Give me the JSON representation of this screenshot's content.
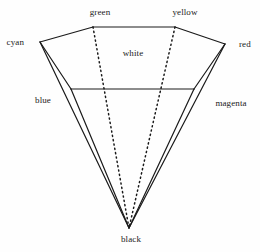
{
  "figure": {
    "background_color": "#fefefe",
    "stroke_color": "#1a1a1a",
    "labels": {
      "green": "green",
      "yellow": "yellow",
      "cyan": "cyan",
      "red": "red",
      "white": "white",
      "blue": "blue",
      "magenta": "magenta",
      "black": "black"
    }
  },
  "chart_data": {
    "type": "diagram",
    "vertices": {
      "cyan": [
        40,
        42
      ],
      "green": [
        93,
        27
      ],
      "yellow": [
        175,
        27
      ],
      "red": [
        225,
        44
      ],
      "white": [
        133,
        57
      ],
      "black": [
        129,
        228
      ],
      "inner_left": [
        71,
        89
      ],
      "inner_right": [
        194,
        89
      ]
    },
    "solid_edges": [
      [
        [
          40,
          42
        ],
        [
          93,
          27
        ]
      ],
      [
        [
          93,
          27
        ],
        [
          175,
          27
        ]
      ],
      [
        [
          175,
          27
        ],
        [
          225,
          44
        ]
      ],
      [
        [
          40,
          42
        ],
        [
          71,
          89
        ]
      ],
      [
        [
          71,
          89
        ],
        [
          194,
          89
        ]
      ],
      [
        [
          194,
          89
        ],
        [
          225,
          44
        ]
      ],
      [
        [
          40,
          42
        ],
        [
          129,
          228
        ]
      ],
      [
        [
          71,
          89
        ],
        [
          129,
          228
        ]
      ],
      [
        [
          225,
          44
        ],
        [
          129,
          228
        ]
      ],
      [
        [
          194,
          89
        ],
        [
          129,
          228
        ]
      ]
    ],
    "dotted_edges": [
      [
        [
          93,
          27
        ],
        [
          129,
          228
        ]
      ],
      [
        [
          175,
          27
        ],
        [
          129,
          228
        ]
      ]
    ],
    "label_positions": {
      "green": [
        100,
        12
      ],
      "yellow": [
        185,
        12
      ],
      "cyan": [
        24,
        42
      ],
      "red": [
        239,
        44
      ],
      "white": [
        133,
        53
      ],
      "blue": [
        43,
        100
      ],
      "magenta": [
        231,
        103
      ],
      "black": [
        131,
        239
      ]
    }
  }
}
